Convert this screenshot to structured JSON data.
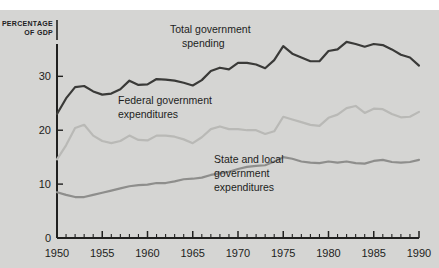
{
  "figure": {
    "background_color": "#d5d5d3",
    "page_color": "#ffffff"
  },
  "axis_title": {
    "line1": "PERCENTAGE",
    "line2": "OF GDP"
  },
  "annotations": {
    "total": {
      "line1": "Total government",
      "line2": "spending"
    },
    "federal": {
      "line1": "Federal government",
      "line2": "expenditures"
    },
    "state": {
      "line1": "State and local",
      "line2": "government",
      "line3": "expenditures"
    }
  },
  "chart_data": {
    "type": "line",
    "title": "",
    "xlabel": "",
    "ylabel": "PERCENTAGE OF GDP",
    "xlim": [
      1950,
      1990
    ],
    "ylim": [
      0,
      36
    ],
    "grid": false,
    "legend": "inline-annotations",
    "ytick_labels": [
      "0",
      "10",
      "20",
      "30"
    ],
    "ytick_values": [
      0,
      10,
      20,
      30
    ],
    "xtick_labels": [
      "1950",
      "1955",
      "1960",
      "1965",
      "1970",
      "1975",
      "1980",
      "1985",
      "1990"
    ],
    "xtick_values": [
      1950,
      1955,
      1960,
      1965,
      1970,
      1975,
      1980,
      1985,
      1990
    ],
    "minor_xticks_every": 1,
    "x": [
      1950,
      1951,
      1952,
      1953,
      1954,
      1955,
      1956,
      1957,
      1958,
      1959,
      1960,
      1961,
      1962,
      1963,
      1964,
      1965,
      1966,
      1967,
      1968,
      1969,
      1970,
      1971,
      1972,
      1973,
      1974,
      1975,
      1976,
      1977,
      1978,
      1979,
      1980,
      1981,
      1982,
      1983,
      1984,
      1985,
      1986,
      1987,
      1988,
      1989,
      1990
    ],
    "series": [
      {
        "name": "Total government spending",
        "color": "#3a3a38",
        "width": 2.2,
        "values": [
          23.0,
          25.9,
          28.0,
          28.2,
          27.2,
          26.6,
          26.8,
          27.6,
          29.2,
          28.4,
          28.5,
          29.5,
          29.4,
          29.2,
          28.8,
          28.3,
          29.3,
          31.0,
          31.6,
          31.3,
          32.5,
          32.5,
          32.2,
          31.5,
          33.0,
          35.6,
          34.2,
          33.5,
          32.8,
          32.8,
          34.7,
          35.0,
          36.4,
          36.0,
          35.5,
          36.0,
          35.8,
          35.0,
          34.0,
          33.5,
          32.0
        ]
      },
      {
        "name": "Federal government expenditures",
        "color": "#b9b9b6",
        "width": 2.2,
        "values": [
          14.6,
          17.2,
          20.4,
          21.0,
          19.0,
          18.0,
          17.6,
          18.0,
          19.0,
          18.2,
          18.1,
          19.0,
          19.0,
          18.8,
          18.3,
          17.6,
          18.7,
          20.2,
          20.7,
          20.2,
          20.2,
          20.0,
          20.0,
          19.3,
          19.8,
          22.5,
          22.0,
          21.5,
          21.0,
          20.8,
          22.3,
          22.9,
          24.1,
          24.5,
          23.2,
          24.0,
          23.9,
          23.0,
          22.4,
          22.5,
          23.4
        ]
      },
      {
        "name": "State and local government expenditures",
        "color": "#8e8e8c",
        "width": 2.2,
        "values": [
          8.5,
          8.0,
          7.6,
          7.6,
          8.0,
          8.4,
          8.8,
          9.2,
          9.6,
          9.8,
          9.9,
          10.2,
          10.2,
          10.5,
          10.9,
          11.0,
          11.2,
          11.7,
          12.0,
          12.3,
          12.8,
          13.2,
          13.4,
          13.5,
          14.2,
          15.0,
          14.7,
          14.2,
          14.0,
          13.9,
          14.2,
          14.0,
          14.2,
          13.9,
          13.8,
          14.3,
          14.5,
          14.1,
          14.0,
          14.1,
          14.5
        ]
      }
    ]
  }
}
